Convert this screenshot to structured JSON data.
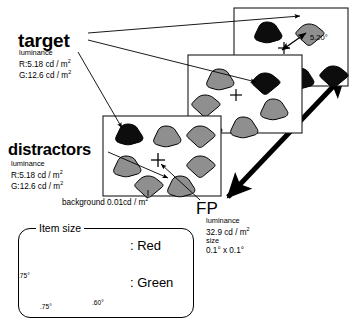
{
  "figure": {
    "type": "visual-search-stimulus-diagram",
    "background_color": "#ffffff"
  },
  "labels": {
    "target": {
      "heading": "target",
      "lum_title": "luminance",
      "lum_red": "R:5.18 cd / m",
      "lum_red_sup": "2",
      "lum_green": "G:12.6 cd / m",
      "lum_green_sup": "2"
    },
    "distractors": {
      "heading": "distractors",
      "lum_title": "luminance",
      "lum_red": "R:5.18 cd / m",
      "lum_red_sup": "2",
      "lum_green": "G:12.6 cd / m",
      "lum_green_sup": "2"
    },
    "background": {
      "text": "background  0.01cd / m",
      "sup": "2"
    },
    "fp": {
      "heading": "FP",
      "lum_title": "luminance",
      "lum_value": "32.9 cd / m",
      "lum_sup": "2",
      "size_title": "size",
      "size_value": "0.1° x 0.1°"
    },
    "eccentricity": "5.20°"
  },
  "legend": {
    "title": "Item size",
    "red_label": ": Red",
    "green_label": ": Green",
    "dim_height": ".75°",
    "dim_width": ".75°",
    "dim_width2": ".60°"
  },
  "colors": {
    "target_black": "#0d0d0d",
    "distractor_gray": "#8f8f8f",
    "distractor_gray_dark": "#767676",
    "outline": "#000000",
    "panel_border": "#1a1a1a"
  },
  "panels": [
    {
      "name": "panel-back",
      "items": [
        {
          "shape": "fan",
          "fill": "black",
          "x": 22,
          "y": 14
        },
        {
          "shape": "fan",
          "fill": "black",
          "x": 18,
          "y": 48
        },
        {
          "shape": "gem",
          "fill": "gray",
          "x": 62,
          "y": 16,
          "is_target_probe": true
        },
        {
          "shape": "fan",
          "fill": "black",
          "x": 54,
          "y": 62
        },
        {
          "shape": "gem",
          "fill": "black",
          "x": 88,
          "y": 60
        }
      ],
      "fixation": {
        "x": 50,
        "y": 44
      }
    },
    {
      "name": "panel-middle",
      "items": [
        {
          "shape": "fan",
          "fill": "gray",
          "x": 18,
          "y": 18
        },
        {
          "shape": "gem",
          "fill": "black",
          "x": 66,
          "y": 22
        },
        {
          "shape": "gem",
          "fill": "gray",
          "x": 8,
          "y": 48
        },
        {
          "shape": "fan",
          "fill": "gray",
          "x": 72,
          "y": 56
        },
        {
          "shape": "gem",
          "fill": "gray",
          "x": 12,
          "y": 80
        },
        {
          "shape": "fan",
          "fill": "gray",
          "x": 44,
          "y": 80
        }
      ],
      "fixation": {
        "x": 46,
        "y": 50
      }
    },
    {
      "name": "panel-front",
      "items": [
        {
          "shape": "fan",
          "fill": "black",
          "x": 14,
          "y": 12,
          "is_target": true
        },
        {
          "shape": "fan",
          "fill": "gray",
          "x": 52,
          "y": 12
        },
        {
          "shape": "gem",
          "fill": "gray",
          "x": 88,
          "y": 12
        },
        {
          "shape": "fan",
          "fill": "gray",
          "x": 14,
          "y": 44
        },
        {
          "shape": "gem",
          "fill": "gray",
          "x": 88,
          "y": 44
        },
        {
          "shape": "gem",
          "fill": "gray",
          "x": 36,
          "y": 68
        },
        {
          "shape": "fan",
          "fill": "gray",
          "x": 68,
          "y": 68
        }
      ],
      "fixation": {
        "x": 60,
        "y": 48
      }
    }
  ]
}
